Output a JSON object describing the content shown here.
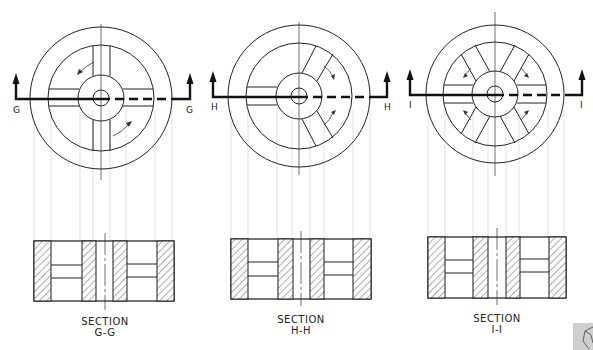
{
  "figure": {
    "views": [
      {
        "id": "G",
        "cut_label_left": "G",
        "cut_label_right": "G",
        "section_title": "SECTION",
        "section_id": "G-G",
        "spokes": 4,
        "center": [
          101,
          98
        ]
      },
      {
        "id": "H",
        "cut_label_left": "H",
        "cut_label_right": "H",
        "section_title": "SECTION",
        "section_id": "H-H",
        "spokes": 3,
        "center": [
          299,
          96
        ]
      },
      {
        "id": "I",
        "cut_label_left": "I",
        "cut_label_right": "I",
        "section_title": "SECTION",
        "section_id": "I-I",
        "spokes": 6,
        "center": [
          495,
          94
        ]
      }
    ],
    "colors": {
      "line": "#222222",
      "projection": "#d6d6d6",
      "corner_tile": "#cfcfcf"
    }
  }
}
